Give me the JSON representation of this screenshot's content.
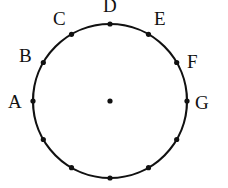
{
  "diagram": {
    "center": {
      "x": 110,
      "y": 101
    },
    "radius": 77,
    "stroke_color": "#111111",
    "points": [
      {
        "label": "A",
        "angle": 180
      },
      {
        "label": "B",
        "angle": 150
      },
      {
        "label": "C",
        "angle": 120
      },
      {
        "label": "D",
        "angle": 90
      },
      {
        "label": "E",
        "angle": 60
      },
      {
        "label": "F",
        "angle": 30
      },
      {
        "label": "G",
        "angle": 0
      },
      {
        "label": "",
        "angle": 330
      },
      {
        "label": "",
        "angle": 300
      },
      {
        "label": "",
        "angle": 270
      },
      {
        "label": "",
        "angle": 240
      },
      {
        "label": "",
        "angle": 210
      }
    ],
    "labels": {
      "A": "A",
      "B": "B",
      "C": "C",
      "D": "D",
      "E": "E",
      "F": "F",
      "G": "G"
    }
  }
}
